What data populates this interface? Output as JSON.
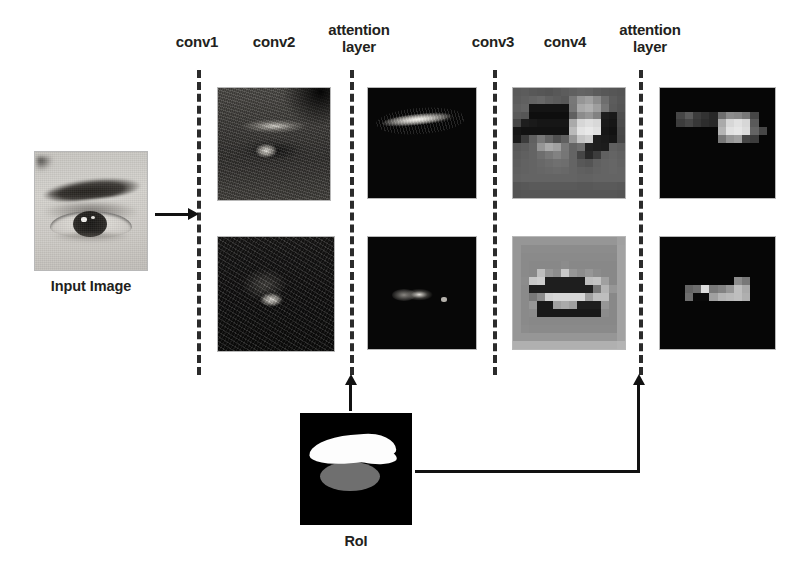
{
  "figure": {
    "background_color": "#ffffff",
    "width": 795,
    "height": 575
  },
  "stage_labels": [
    {
      "id": "conv1",
      "text": "conv1",
      "x": 166,
      "y": 34,
      "width": 62
    },
    {
      "id": "conv2",
      "text": "conv2",
      "x": 243,
      "y": 34,
      "width": 62
    },
    {
      "id": "attention-layer-1",
      "text": "attention\nlayer",
      "x": 316,
      "y": 22,
      "width": 86
    },
    {
      "id": "conv3",
      "text": "conv3",
      "x": 462,
      "y": 34,
      "width": 62
    },
    {
      "id": "conv4",
      "text": "conv4",
      "x": 534,
      "y": 34,
      "width": 62
    },
    {
      "id": "attention-layer-2",
      "text": "attention\nlayer",
      "x": 607,
      "y": 22,
      "width": 86
    }
  ],
  "stage_lines": [
    {
      "id": "conv1-line",
      "x": 197,
      "y": 70,
      "height": 305
    },
    {
      "id": "attention-1-line",
      "x": 350,
      "y": 70,
      "height": 305
    },
    {
      "id": "conv3-line",
      "x": 493,
      "y": 70,
      "height": 305
    },
    {
      "id": "attention-2-line",
      "x": 639,
      "y": 70,
      "height": 305
    }
  ],
  "captions": {
    "input_image": "Input Image",
    "roi": "RoI"
  },
  "images": {
    "input": {
      "name": "input-eye-photo",
      "x": 35,
      "y": 152,
      "w": 112,
      "h": 118,
      "description": "grayscale close-up photo of a human eye and eyebrow"
    },
    "conv2_top": {
      "name": "conv2-feature-map-top",
      "x": 218,
      "y": 88,
      "w": 112,
      "h": 112,
      "description": "conv2 activation: bright eyebrow arc and iris on dark face texture"
    },
    "conv2_bottom": {
      "name": "conv2-feature-map-bottom",
      "x": 218,
      "y": 237,
      "w": 116,
      "h": 114,
      "description": "conv2 activation: dark map with bright iris blob"
    },
    "attention1_top": {
      "name": "attention1-feature-map-top",
      "x": 368,
      "y": 88,
      "w": 108,
      "h": 110,
      "description": "attention masked: only eyebrow region remains bright on black"
    },
    "attention1_bottom": {
      "name": "attention1-feature-map-bottom",
      "x": 368,
      "y": 237,
      "w": 108,
      "h": 112,
      "description": "attention masked: only eye region remains bright on black"
    },
    "conv4_top": {
      "name": "conv4-feature-map-top",
      "x": 513,
      "y": 88,
      "w": 112,
      "h": 110,
      "description": "conv4 coarse pixelated activation, mid-gray with dark and bright bars"
    },
    "conv4_bottom": {
      "name": "conv4-feature-map-bottom",
      "x": 513,
      "y": 237,
      "w": 112,
      "h": 112,
      "description": "conv4 coarse pixelated activation, light gray with central dark blocks"
    },
    "attention2_top": {
      "name": "attention2-feature-map-top",
      "x": 660,
      "y": 88,
      "w": 115,
      "h": 110,
      "description": "attention masked coarse map: horizontal bright block band on black"
    },
    "attention2_bottom": {
      "name": "attention2-feature-map-bottom",
      "x": 660,
      "y": 237,
      "w": 115,
      "h": 112,
      "description": "attention masked coarse map: small bright block cluster on black"
    },
    "roi": {
      "name": "roi-mask",
      "x": 300,
      "y": 413,
      "w": 112,
      "h": 112,
      "description": "region of interest mask: white eyebrow blob above gray eye ellipse on black"
    }
  },
  "arrows": [
    {
      "id": "input-to-conv1",
      "direction": "right",
      "from": "input-image",
      "to": "conv1-line"
    },
    {
      "id": "roi-to-attention-1",
      "direction": "up",
      "from": "roi-mask",
      "to": "attention-1-line"
    },
    {
      "id": "roi-to-attention-2",
      "direction": "right-then-up",
      "from": "roi-mask",
      "to": "attention-2-line"
    }
  ],
  "colors": {
    "background": "#ffffff",
    "text": "#231f20",
    "line": "#2b2b2b",
    "arrow": "#111111",
    "roi_brow": "#fdfdfd",
    "roi_eye": "#6f6f6f"
  },
  "pixel_maps": {
    "conv4_top": [
      [
        90,
        92,
        88,
        86,
        84,
        88,
        92,
        96,
        100,
        98,
        92,
        88,
        86,
        84
      ],
      [
        92,
        96,
        100,
        104,
        96,
        92,
        88,
        120,
        150,
        160,
        140,
        110,
        92,
        86
      ],
      [
        96,
        100,
        20,
        20,
        20,
        20,
        20,
        118,
        168,
        176,
        158,
        118,
        90,
        84
      ],
      [
        90,
        86,
        14,
        14,
        14,
        14,
        14,
        96,
        140,
        150,
        130,
        30,
        26,
        78
      ],
      [
        70,
        30,
        26,
        22,
        22,
        22,
        22,
        170,
        214,
        222,
        216,
        26,
        22,
        76
      ],
      [
        22,
        18,
        18,
        18,
        18,
        18,
        18,
        186,
        226,
        232,
        224,
        22,
        18,
        72
      ],
      [
        26,
        60,
        96,
        120,
        100,
        80,
        96,
        150,
        196,
        206,
        30,
        26,
        22,
        70
      ],
      [
        88,
        92,
        100,
        150,
        170,
        160,
        120,
        100,
        110,
        34,
        30,
        28,
        96,
        92
      ],
      [
        92,
        96,
        100,
        110,
        120,
        130,
        118,
        100,
        70,
        40,
        60,
        96,
        100,
        96
      ],
      [
        94,
        98,
        100,
        104,
        108,
        112,
        110,
        100,
        88,
        84,
        96,
        100,
        102,
        98
      ],
      [
        96,
        98,
        100,
        102,
        104,
        106,
        104,
        100,
        96,
        94,
        98,
        100,
        102,
        100
      ],
      [
        98,
        100,
        100,
        100,
        100,
        100,
        100,
        100,
        98,
        98,
        100,
        100,
        100,
        100
      ],
      [
        86,
        88,
        90,
        90,
        90,
        90,
        90,
        90,
        88,
        88,
        90,
        90,
        90,
        88
      ],
      [
        84,
        86,
        86,
        86,
        86,
        86,
        86,
        86,
        86,
        86,
        86,
        86,
        86,
        84
      ]
    ],
    "conv4_bottom": [
      [
        150,
        150,
        150,
        150,
        150,
        150,
        150,
        150,
        150,
        150,
        150,
        150,
        150,
        160
      ],
      [
        150,
        140,
        140,
        140,
        140,
        140,
        140,
        140,
        140,
        140,
        140,
        140,
        140,
        162
      ],
      [
        150,
        138,
        138,
        138,
        138,
        138,
        138,
        138,
        138,
        138,
        138,
        138,
        138,
        162
      ],
      [
        150,
        138,
        136,
        136,
        136,
        136,
        140,
        136,
        136,
        136,
        136,
        136,
        136,
        162
      ],
      [
        150,
        138,
        136,
        190,
        150,
        140,
        200,
        150,
        140,
        150,
        140,
        136,
        136,
        162
      ],
      [
        150,
        140,
        200,
        205,
        30,
        30,
        30,
        30,
        30,
        190,
        195,
        160,
        136,
        162
      ],
      [
        150,
        138,
        30,
        30,
        30,
        30,
        30,
        30,
        30,
        30,
        120,
        180,
        150,
        162
      ],
      [
        150,
        138,
        120,
        140,
        210,
        215,
        215,
        215,
        215,
        160,
        190,
        190,
        136,
        162
      ],
      [
        150,
        138,
        150,
        25,
        25,
        160,
        170,
        160,
        30,
        30,
        30,
        150,
        136,
        162
      ],
      [
        150,
        138,
        140,
        25,
        25,
        25,
        25,
        25,
        25,
        25,
        25,
        140,
        136,
        162
      ],
      [
        150,
        138,
        136,
        136,
        136,
        136,
        136,
        136,
        136,
        136,
        136,
        136,
        136,
        162
      ],
      [
        150,
        140,
        138,
        138,
        138,
        138,
        138,
        138,
        138,
        138,
        138,
        138,
        138,
        162
      ],
      [
        150,
        150,
        150,
        150,
        150,
        150,
        150,
        150,
        150,
        150,
        150,
        150,
        150,
        162
      ],
      [
        176,
        176,
        176,
        176,
        176,
        176,
        176,
        176,
        176,
        176,
        176,
        176,
        176,
        180
      ]
    ],
    "attention2_top": [
      [
        6,
        6,
        6,
        6,
        6,
        6,
        6,
        6,
        6,
        6,
        6,
        6,
        6,
        6
      ],
      [
        6,
        6,
        6,
        6,
        6,
        6,
        6,
        6,
        6,
        6,
        6,
        6,
        6,
        6
      ],
      [
        6,
        6,
        6,
        6,
        6,
        6,
        6,
        6,
        6,
        6,
        6,
        6,
        6,
        6
      ],
      [
        6,
        6,
        70,
        90,
        60,
        50,
        40,
        110,
        140,
        135,
        120,
        70,
        6,
        6
      ],
      [
        6,
        6,
        60,
        70,
        55,
        45,
        40,
        170,
        215,
        225,
        215,
        90,
        6,
        6
      ],
      [
        6,
        6,
        6,
        6,
        6,
        6,
        6,
        180,
        225,
        230,
        220,
        100,
        70,
        6
      ],
      [
        6,
        6,
        6,
        6,
        6,
        6,
        6,
        120,
        150,
        160,
        70,
        60,
        6,
        6
      ],
      [
        6,
        6,
        6,
        6,
        6,
        6,
        6,
        6,
        6,
        6,
        6,
        6,
        6,
        6
      ],
      [
        6,
        6,
        6,
        6,
        6,
        6,
        6,
        6,
        6,
        6,
        6,
        6,
        6,
        6
      ],
      [
        6,
        6,
        6,
        6,
        6,
        6,
        6,
        6,
        6,
        6,
        6,
        6,
        6,
        6
      ],
      [
        6,
        6,
        6,
        6,
        6,
        6,
        6,
        6,
        6,
        6,
        6,
        6,
        6,
        6
      ],
      [
        6,
        6,
        6,
        6,
        6,
        6,
        6,
        6,
        6,
        6,
        6,
        6,
        6,
        6
      ],
      [
        6,
        6,
        6,
        6,
        6,
        6,
        6,
        6,
        6,
        6,
        6,
        6,
        6,
        6
      ],
      [
        6,
        6,
        6,
        6,
        6,
        6,
        6,
        6,
        6,
        6,
        6,
        6,
        6,
        6
      ]
    ],
    "attention2_bottom": [
      [
        6,
        6,
        6,
        6,
        6,
        6,
        6,
        6,
        6,
        6,
        6,
        6,
        6,
        6
      ],
      [
        6,
        6,
        6,
        6,
        6,
        6,
        6,
        6,
        6,
        6,
        6,
        6,
        6,
        6
      ],
      [
        6,
        6,
        6,
        6,
        6,
        6,
        6,
        6,
        6,
        6,
        6,
        6,
        6,
        6
      ],
      [
        6,
        6,
        6,
        6,
        6,
        6,
        6,
        6,
        6,
        6,
        6,
        6,
        6,
        6
      ],
      [
        6,
        6,
        6,
        6,
        6,
        6,
        6,
        6,
        6,
        6,
        6,
        6,
        6,
        6
      ],
      [
        6,
        6,
        6,
        6,
        6,
        6,
        6,
        6,
        6,
        140,
        120,
        6,
        6,
        6
      ],
      [
        6,
        6,
        6,
        100,
        110,
        220,
        120,
        130,
        150,
        190,
        170,
        6,
        6,
        6
      ],
      [
        6,
        6,
        6,
        110,
        10,
        10,
        160,
        180,
        185,
        190,
        175,
        6,
        6,
        6
      ],
      [
        6,
        6,
        6,
        6,
        6,
        6,
        6,
        6,
        6,
        6,
        6,
        6,
        6,
        6
      ],
      [
        6,
        6,
        6,
        6,
        6,
        6,
        6,
        6,
        6,
        6,
        6,
        6,
        6,
        6
      ],
      [
        6,
        6,
        6,
        6,
        6,
        6,
        6,
        6,
        6,
        6,
        6,
        6,
        6,
        6
      ],
      [
        6,
        6,
        6,
        6,
        6,
        6,
        6,
        6,
        6,
        6,
        6,
        6,
        6,
        6
      ],
      [
        6,
        6,
        6,
        6,
        6,
        6,
        6,
        6,
        6,
        6,
        6,
        6,
        6,
        6
      ],
      [
        6,
        6,
        6,
        6,
        6,
        6,
        6,
        6,
        6,
        6,
        6,
        6,
        6,
        6
      ]
    ]
  }
}
